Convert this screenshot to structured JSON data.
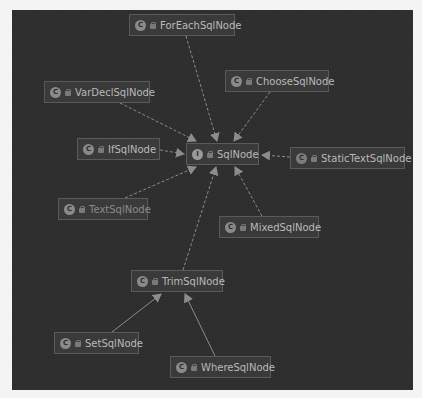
{
  "diagram": {
    "type": "uml-class-hierarchy",
    "colors": {
      "canvas": "#2e2e2e",
      "node_fill": "#3a3a3a",
      "node_border": "#5a5a5a",
      "text": "#b9b9b9",
      "edge": "#8c8c8c"
    },
    "nodes": [
      {
        "id": "ForEachSqlNode",
        "label": "ForEachSqlNode",
        "kind": "class",
        "kind_glyph": "C"
      },
      {
        "id": "ChooseSqlNode",
        "label": "ChooseSqlNode",
        "kind": "class",
        "kind_glyph": "C"
      },
      {
        "id": "VarDeclSqlNode",
        "label": "VarDeclSqlNode",
        "kind": "class",
        "kind_glyph": "C"
      },
      {
        "id": "IfSqlNode",
        "label": "IfSqlNode",
        "kind": "class",
        "kind_glyph": "C"
      },
      {
        "id": "SqlNode",
        "label": "SqlNode",
        "kind": "interface",
        "kind_glyph": "I"
      },
      {
        "id": "StaticTextSqlNode",
        "label": "StaticTextSqlNode",
        "kind": "class",
        "kind_glyph": "C"
      },
      {
        "id": "TextSqlNode",
        "label": "TextSqlNode",
        "kind": "class",
        "kind_glyph": "C"
      },
      {
        "id": "MixedSqlNode",
        "label": "MixedSqlNode",
        "kind": "class",
        "kind_glyph": "C"
      },
      {
        "id": "TrimSqlNode",
        "label": "TrimSqlNode",
        "kind": "class",
        "kind_glyph": "C"
      },
      {
        "id": "SetSqlNode",
        "label": "SetSqlNode",
        "kind": "class",
        "kind_glyph": "C"
      },
      {
        "id": "WhereSqlNode",
        "label": "WhereSqlNode",
        "kind": "class",
        "kind_glyph": "C"
      }
    ],
    "edges": [
      {
        "from": "ForEachSqlNode",
        "to": "SqlNode",
        "relation": "implements",
        "style": "dashed"
      },
      {
        "from": "ChooseSqlNode",
        "to": "SqlNode",
        "relation": "implements",
        "style": "dashed"
      },
      {
        "from": "VarDeclSqlNode",
        "to": "SqlNode",
        "relation": "implements",
        "style": "dashed"
      },
      {
        "from": "IfSqlNode",
        "to": "SqlNode",
        "relation": "implements",
        "style": "dashed"
      },
      {
        "from": "StaticTextSqlNode",
        "to": "SqlNode",
        "relation": "implements",
        "style": "dashed"
      },
      {
        "from": "TextSqlNode",
        "to": "SqlNode",
        "relation": "implements",
        "style": "dashed"
      },
      {
        "from": "MixedSqlNode",
        "to": "SqlNode",
        "relation": "implements",
        "style": "dashed"
      },
      {
        "from": "TrimSqlNode",
        "to": "SqlNode",
        "relation": "implements",
        "style": "dashed"
      },
      {
        "from": "SetSqlNode",
        "to": "TrimSqlNode",
        "relation": "extends",
        "style": "solid"
      },
      {
        "from": "WhereSqlNode",
        "to": "TrimSqlNode",
        "relation": "extends",
        "style": "solid"
      }
    ]
  }
}
